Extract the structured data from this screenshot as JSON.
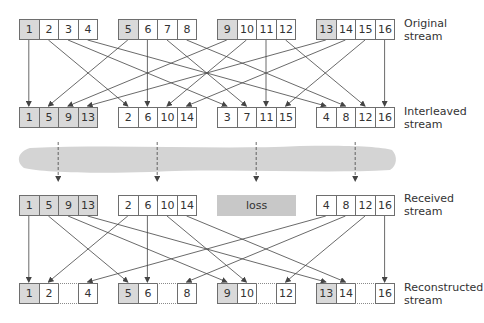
{
  "diagram": {
    "rows": [
      {
        "id": "original",
        "label_line1": "Original",
        "label_line2": "stream",
        "groups": [
          [
            "1",
            "2",
            "3",
            "4"
          ],
          [
            "5",
            "6",
            "7",
            "8"
          ],
          [
            "9",
            "10",
            "11",
            "12"
          ],
          [
            "13",
            "14",
            "15",
            "16"
          ]
        ],
        "shaded": [
          "1",
          "5",
          "9",
          "13"
        ]
      },
      {
        "id": "interleaved",
        "label_line1": "Interleaved",
        "label_line2": "stream",
        "groups": [
          [
            "1",
            "5",
            "9",
            "13"
          ],
          [
            "2",
            "6",
            "10",
            "14"
          ],
          [
            "3",
            "7",
            "11",
            "15"
          ],
          [
            "4",
            "8",
            "12",
            "16"
          ]
        ],
        "shaded": [
          "1",
          "5",
          "9",
          "13"
        ]
      },
      {
        "id": "received",
        "label_line1": "Received",
        "label_line2": "stream",
        "groups": [
          [
            "1",
            "5",
            "9",
            "13"
          ],
          [
            "2",
            "6",
            "10",
            "14"
          ],
          null,
          [
            "4",
            "8",
            "12",
            "16"
          ]
        ],
        "shaded": [
          "1",
          "5",
          "9",
          "13"
        ],
        "loss_label": "loss"
      },
      {
        "id": "reconstructed",
        "label_line1": "Reconstructed",
        "label_line2": "stream",
        "groups": [
          [
            "1",
            "2",
            "",
            "4"
          ],
          [
            "5",
            "6",
            "",
            "8"
          ],
          [
            "9",
            "10",
            "",
            "12"
          ],
          [
            "13",
            "14",
            "",
            "16"
          ]
        ],
        "shaded": [
          "1",
          "5",
          "9",
          "13"
        ]
      }
    ],
    "colors": {
      "shaded_cell": "#d9d9d9",
      "cell_border": "#6e6e6e",
      "network_cloud": "#d4d4d4",
      "loss_box": "#c8c8c8",
      "line": "#444444"
    }
  }
}
